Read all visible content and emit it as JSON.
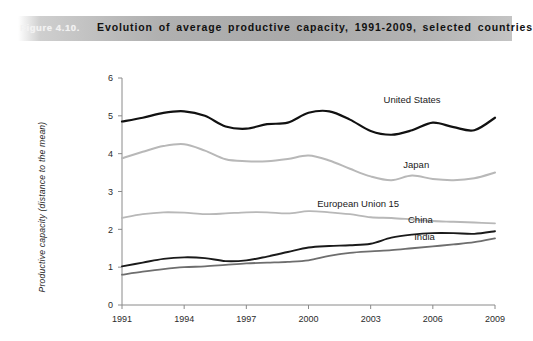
{
  "header": {
    "figure_number": "Figure 4.10.",
    "title": "Evolution of average productive capacity, 1991-2009, selected countries",
    "band_color": "#aaaaaa",
    "title_color": "#111111",
    "number_color": "#f2f2f2"
  },
  "chart_data": {
    "type": "line",
    "title": "Evolution of average productive capacity, 1991-2009, selected countries",
    "xlabel": "",
    "ylabel": "Productive capacity (distance to the mean)",
    "xlim": [
      1991,
      2009
    ],
    "ylim": [
      0,
      6
    ],
    "yticks": [
      0,
      1,
      2,
      3,
      4,
      5,
      6
    ],
    "xticks": [
      1991,
      1994,
      1997,
      2000,
      2003,
      2006,
      2009
    ],
    "grid": false,
    "legend_position": "inline-right-of-series",
    "x": [
      1991,
      1992,
      1993,
      1994,
      1995,
      1996,
      1997,
      1998,
      1999,
      2000,
      2001,
      2002,
      2003,
      2004,
      2005,
      2006,
      2007,
      2008,
      2009
    ],
    "series": [
      {
        "name": "United States",
        "color": "#111111",
        "width": 2.2,
        "label_x": 2005.0,
        "label_y": 5.35,
        "values": [
          4.85,
          4.95,
          5.08,
          5.12,
          5.0,
          4.72,
          4.66,
          4.78,
          4.82,
          5.08,
          5.12,
          4.9,
          4.6,
          4.5,
          4.62,
          4.82,
          4.7,
          4.62,
          4.95
        ]
      },
      {
        "name": "Japan",
        "color": "#b8b8b8",
        "width": 2.0,
        "label_x": 2005.2,
        "label_y": 3.62,
        "values": [
          3.88,
          4.05,
          4.2,
          4.25,
          4.08,
          3.85,
          3.8,
          3.8,
          3.86,
          3.95,
          3.82,
          3.6,
          3.4,
          3.3,
          3.42,
          3.33,
          3.3,
          3.35,
          3.5
        ]
      },
      {
        "name": "European Union 15",
        "color": "#b8b8b8",
        "width": 1.8,
        "label_x": 2002.4,
        "label_y": 2.58,
        "values": [
          2.3,
          2.4,
          2.45,
          2.44,
          2.4,
          2.42,
          2.45,
          2.45,
          2.42,
          2.48,
          2.45,
          2.4,
          2.32,
          2.3,
          2.26,
          2.22,
          2.2,
          2.18,
          2.16
        ]
      },
      {
        "name": "China",
        "color": "#1a1a1a",
        "width": 1.9,
        "label_x": 2005.4,
        "label_y": 2.18,
        "values": [
          1.02,
          1.12,
          1.22,
          1.26,
          1.24,
          1.16,
          1.18,
          1.28,
          1.4,
          1.52,
          1.56,
          1.58,
          1.62,
          1.78,
          1.86,
          1.9,
          1.9,
          1.88,
          1.95
        ]
      },
      {
        "name": "India",
        "color": "#6e6e6e",
        "width": 1.8,
        "label_x": 2005.6,
        "label_y": 1.72,
        "values": [
          0.8,
          0.88,
          0.95,
          1.0,
          1.02,
          1.06,
          1.1,
          1.12,
          1.14,
          1.18,
          1.3,
          1.38,
          1.42,
          1.45,
          1.5,
          1.55,
          1.6,
          1.66,
          1.76
        ]
      }
    ]
  }
}
